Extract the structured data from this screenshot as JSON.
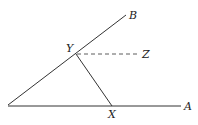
{
  "diagram": {
    "type": "geometry-angle-construction",
    "colors": {
      "line": "#333333",
      "label": "#222222",
      "background": "#ffffff"
    },
    "points": {
      "O": {
        "x": 8,
        "y": 105,
        "label": ""
      },
      "B": {
        "x": 126,
        "y": 15,
        "label": "B"
      },
      "A": {
        "x": 181,
        "y": 106,
        "label": "A"
      },
      "Y": {
        "x": 76,
        "y": 54,
        "label": "Y"
      },
      "X": {
        "x": 112,
        "y": 106,
        "label": "X"
      },
      "Z": {
        "x": 140,
        "y": 54,
        "label": "Z"
      }
    },
    "segments": [
      {
        "from": "O",
        "to": "B",
        "style": "solid"
      },
      {
        "from": "O",
        "to": "A",
        "style": "solid"
      },
      {
        "from": "Y",
        "to": "X",
        "style": "solid"
      },
      {
        "from": "Y",
        "to": "Z",
        "style": "dashed"
      }
    ],
    "labels": {
      "B": "B",
      "A": "A",
      "Y": "Y",
      "X": "X",
      "Z": "Z"
    }
  }
}
